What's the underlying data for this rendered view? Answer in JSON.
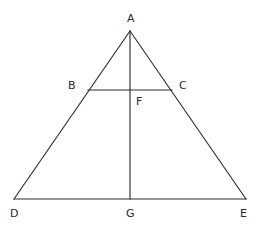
{
  "figure": {
    "background_color": "#ffffff",
    "line_color": "#2e2e2e",
    "label_color": "#2b2b2b",
    "canvas": {
      "width": 260,
      "height": 232
    },
    "points": [
      {
        "id": "A",
        "label": "A",
        "x": 130,
        "y": 31,
        "label_x": 127,
        "label_y": 13
      },
      {
        "id": "B",
        "label": "B",
        "x": 88,
        "y": 90,
        "label_x": 68,
        "label_y": 80
      },
      {
        "id": "C",
        "label": "C",
        "x": 172,
        "y": 90,
        "label_x": 179,
        "label_y": 80
      },
      {
        "id": "D",
        "label": "D",
        "x": 14,
        "y": 199,
        "label_x": 10,
        "label_y": 208
      },
      {
        "id": "E",
        "label": "E",
        "x": 246,
        "y": 199,
        "label_x": 240,
        "label_y": 208
      },
      {
        "id": "F",
        "label": "F",
        "x": 130,
        "y": 90,
        "label_x": 136,
        "label_y": 96
      },
      {
        "id": "G",
        "label": "G",
        "x": 130,
        "y": 199,
        "label_x": 126,
        "label_y": 208
      }
    ],
    "segments": [
      {
        "id": "AD",
        "from": "A",
        "to": "D",
        "x1": 130,
        "y1": 31,
        "x2": 14,
        "y2": 199
      },
      {
        "id": "AE",
        "from": "A",
        "to": "E",
        "x1": 130,
        "y1": 31,
        "x2": 246,
        "y2": 199
      },
      {
        "id": "DE",
        "from": "D",
        "to": "E",
        "x1": 14,
        "y1": 199,
        "x2": 246,
        "y2": 199
      },
      {
        "id": "BC",
        "from": "B",
        "to": "C",
        "x1": 88,
        "y1": 90,
        "x2": 172,
        "y2": 90
      },
      {
        "id": "AG",
        "from": "A",
        "to": "G",
        "x1": 130,
        "y1": 31,
        "x2": 130,
        "y2": 199
      }
    ]
  }
}
